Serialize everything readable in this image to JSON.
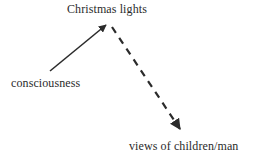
{
  "diagram": {
    "title": "",
    "background_color": "#ffffff",
    "text_color": "#2b2b2b",
    "stroke_color": "#2b2b2b",
    "nodes": [
      {
        "id": "christmas-lights",
        "label": "Christmas lights",
        "x": 67,
        "y": 2
      },
      {
        "id": "consciousness",
        "label": "consciousness",
        "x": 11,
        "y": 76
      },
      {
        "id": "views-of-children-man",
        "label": "views of children/man",
        "x": 129,
        "y": 139
      }
    ],
    "edges": [
      {
        "id": "consciousness-to-christmas-lights",
        "from": "consciousness",
        "to": "christmas-lights",
        "style": "solid",
        "arrowhead": "filled-triangle",
        "label": "",
        "x1": 50,
        "y1": 71,
        "x2": 106,
        "y2": 25
      },
      {
        "id": "christmas-lights-to-views",
        "from": "christmas-lights",
        "to": "views-of-children-man",
        "style": "dashed",
        "arrowhead": "filled-triangle",
        "dash_length": 7,
        "dash_gap": 6,
        "label": "",
        "x1": 112,
        "y1": 27,
        "x2": 181,
        "y2": 130
      }
    ]
  }
}
